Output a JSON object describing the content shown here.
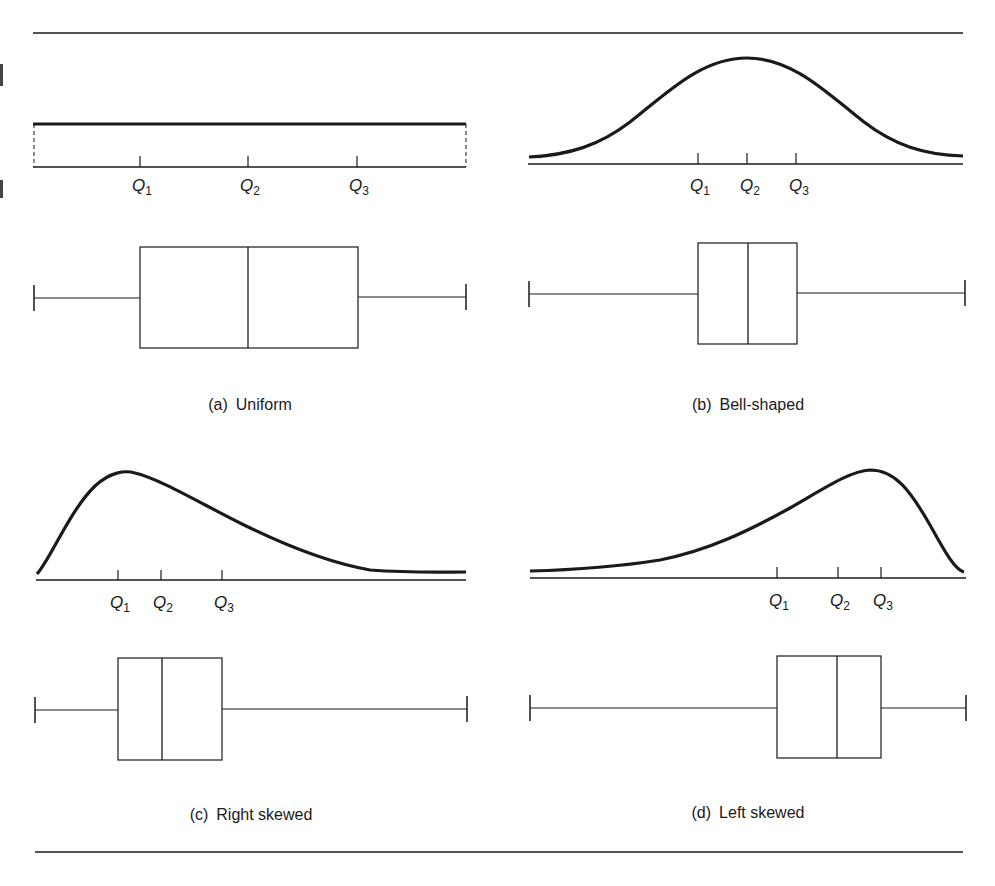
{
  "figure": {
    "panels": [
      {
        "id": "a",
        "tag": "(a)",
        "title": "Uniform",
        "quartile_labels": [
          {
            "q": "Q",
            "sub": "1"
          },
          {
            "q": "Q",
            "sub": "2"
          },
          {
            "q": "Q",
            "sub": "3"
          }
        ]
      },
      {
        "id": "b",
        "tag": "(b)",
        "title": "Bell-shaped",
        "quartile_labels": [
          {
            "q": "Q",
            "sub": "1"
          },
          {
            "q": "Q",
            "sub": "2"
          },
          {
            "q": "Q",
            "sub": "3"
          }
        ]
      },
      {
        "id": "c",
        "tag": "(c)",
        "title": "Right skewed",
        "quartile_labels": [
          {
            "q": "Q",
            "sub": "1"
          },
          {
            "q": "Q",
            "sub": "2"
          },
          {
            "q": "Q",
            "sub": "3"
          }
        ]
      },
      {
        "id": "d",
        "tag": "(d)",
        "title": "Left skewed",
        "quartile_labels": [
          {
            "q": "Q",
            "sub": "1"
          },
          {
            "q": "Q",
            "sub": "2"
          },
          {
            "q": "Q",
            "sub": "3"
          }
        ]
      }
    ],
    "colors": {
      "ink": "#1a1a1a",
      "background": "#ffffff"
    }
  }
}
